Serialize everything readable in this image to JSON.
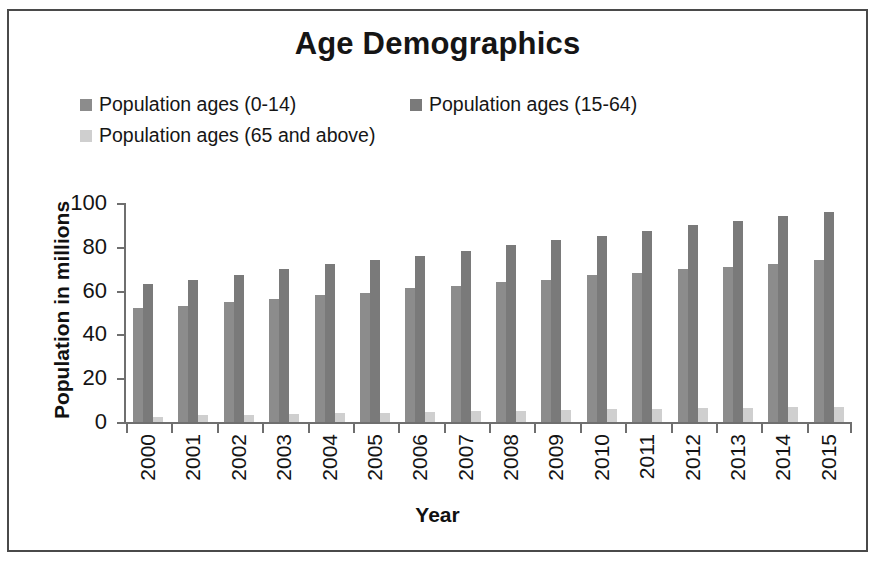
{
  "chart_data": {
    "type": "bar",
    "title": "Age Demographics",
    "xlabel": "Year",
    "ylabel": "Population in millions",
    "categories": [
      "2000",
      "2001",
      "2002",
      "2003",
      "2004",
      "2005",
      "2006",
      "2007",
      "2008",
      "2009",
      "2010",
      "2011",
      "2012",
      "2013",
      "2014",
      "2015"
    ],
    "series": [
      {
        "name": "Population ages (0-14)",
        "color": "#8c8c8c",
        "values": [
          52,
          53,
          55,
          56,
          58,
          59,
          61,
          62,
          64,
          65,
          67,
          68,
          70,
          71,
          72,
          74
        ]
      },
      {
        "name": "Population ages (15-64)",
        "color": "#7a7a7a",
        "values": [
          63,
          65,
          67,
          70,
          72,
          74,
          76,
          78,
          81,
          83,
          85,
          87,
          90,
          92,
          94,
          96
        ]
      },
      {
        "name": "Population ages (65 and above)",
        "color": "#cfcfcf",
        "values": [
          2.5,
          3,
          3.3,
          3.6,
          4,
          4.2,
          4.6,
          4.9,
          5.2,
          5.5,
          5.8,
          6.1,
          6.3,
          6.4,
          6.7,
          7
        ]
      }
    ],
    "ylim": [
      0,
      100
    ],
    "yticks": [
      0,
      20,
      40,
      60,
      80,
      100
    ],
    "grid": false,
    "legend_position": "top"
  },
  "title": "Age Demographics",
  "axes": {
    "y_title": "Population in millions",
    "x_title": "Year",
    "y_ticks": [
      "0",
      "20",
      "40",
      "60",
      "80",
      "100"
    ]
  },
  "legend": {
    "items": [
      {
        "label": "Population ages (0-14)",
        "color": "#8c8c8c"
      },
      {
        "label": "Population ages (15-64)",
        "color": "#7a7a7a"
      },
      {
        "label": "Population ages (65 and above)",
        "color": "#cfcfcf"
      }
    ]
  }
}
